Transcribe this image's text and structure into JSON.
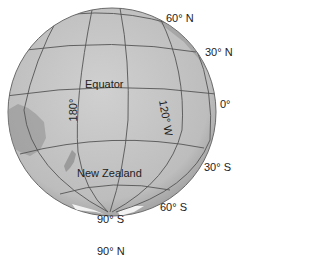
{
  "figure": {
    "type": "orthographic globe",
    "colors": {
      "ocean": "#c4c4c4",
      "grid": "#555555",
      "land": "#8e8e8e",
      "ice": "#f2f2f2",
      "label": "#222222"
    }
  },
  "labels": {
    "lat_60n": "60° N",
    "lat_30n": "30° N",
    "lat_0": "0°",
    "lat_30s": "30° S",
    "lat_60s": "60° S",
    "lat_90s": "90° S",
    "lat_90n": "90° N",
    "equator": "Equator",
    "lon_180": "180°",
    "lon_120w": "120° W",
    "new_zealand": "New Zealand"
  }
}
